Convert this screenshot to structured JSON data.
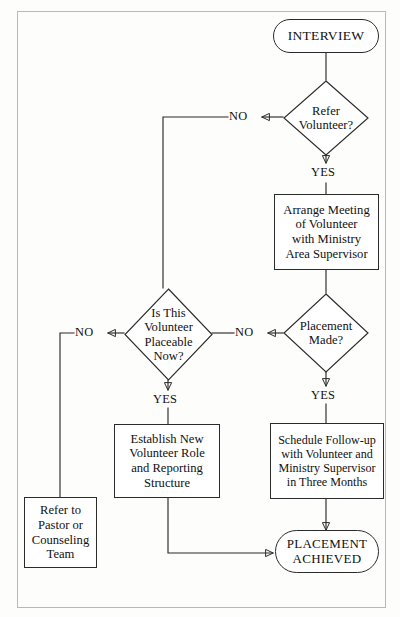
{
  "diagram": {
    "type": "flowchart",
    "stroke_color": "#2b2b2b",
    "border_color": "#b9b9b9",
    "background_color": "#fdfdfc"
  },
  "nodes": {
    "interview": {
      "label": "INTERVIEW",
      "shape": "terminal"
    },
    "refer_volunteer": {
      "label": "Refer\nVolunteer?",
      "line1": "Refer",
      "line2": "Volunteer?",
      "shape": "decision"
    },
    "arrange_meeting": {
      "line1": "Arrange Meeting",
      "line2": "of Volunteer",
      "line3": "with Ministry",
      "line4": "Area Supervisor",
      "shape": "process"
    },
    "placement_made": {
      "line1": "Placement",
      "line2": "Made?",
      "shape": "decision"
    },
    "is_placeable": {
      "line1": "Is This",
      "line2": "Volunteer",
      "line3": "Placeable",
      "line4": "Now?",
      "shape": "decision"
    },
    "establish_role": {
      "line1": "Establish New",
      "line2": "Volunteer Role",
      "line3": "and Reporting",
      "line4": "Structure",
      "shape": "process"
    },
    "schedule_followup": {
      "line1": "Schedule Follow-up",
      "line2": "with Volunteer and",
      "line3": "Ministry Supervisor",
      "line4": "in Three Months",
      "shape": "process"
    },
    "refer_pastor": {
      "line1": "Refer to",
      "line2": "Pastor or",
      "line3": "Counseling",
      "line4": "Team",
      "shape": "process"
    },
    "placement_achieved": {
      "line1": "PLACEMENT",
      "line2": "ACHIEVED",
      "shape": "terminal"
    }
  },
  "edge_labels": {
    "refer_no": "NO",
    "refer_yes": "YES",
    "placement_no": "NO",
    "placement_yes": "YES",
    "placeable_no": "NO",
    "placeable_yes": "YES"
  }
}
